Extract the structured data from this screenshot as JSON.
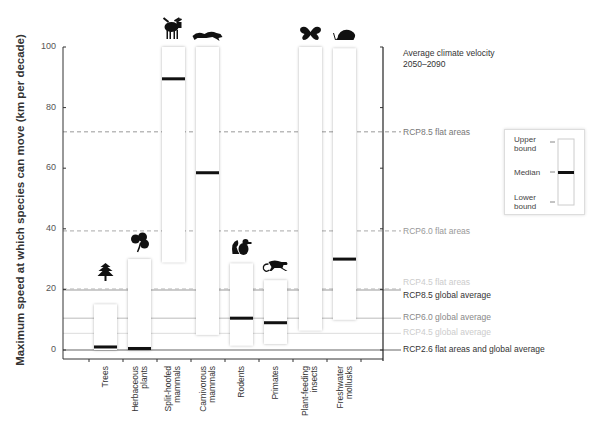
{
  "chart_data": {
    "type": "bar",
    "subtype": "floating-range-with-median",
    "ylabel": "Maximum speed at which species can move (km per decade)",
    "xlabel": "",
    "ylim": [
      0,
      100
    ],
    "yticks": [
      0,
      20,
      40,
      60,
      80,
      100
    ],
    "categories": [
      "Trees",
      "Herbaceous plants",
      "Split-hoofed mammals",
      "Carnivorous mammals",
      "Rodents",
      "Primates",
      "Plant-feeding insects",
      "Freshwater mollusks"
    ],
    "series": [
      {
        "name": "Upper bound",
        "values": [
          15,
          30,
          100,
          100,
          28.5,
          23,
          100,
          99.5
        ]
      },
      {
        "name": "Median",
        "values": [
          1,
          0.5,
          89.5,
          58.5,
          10.5,
          9,
          null,
          30
        ]
      },
      {
        "name": "Lower bound",
        "values": [
          0,
          0,
          29,
          5,
          1.5,
          2,
          6.5,
          10
        ]
      }
    ],
    "reference_lines": [
      {
        "label": "RCP8.5 flat areas",
        "value": 72,
        "style": "dashed",
        "color": "#999999"
      },
      {
        "label": "RCP6.0 flat areas",
        "value": 39.3,
        "style": "dashed",
        "color": "#aaaaaa"
      },
      {
        "label": "RCP4.5 flat areas",
        "value": 20.2,
        "style": "dashed",
        "color": "#cccccc"
      },
      {
        "label": "RCP8.5 global average",
        "value": 19.8,
        "style": "solid",
        "color": "#999999"
      },
      {
        "label": "RCP6.0 global average",
        "value": 10.5,
        "style": "solid",
        "color": "#bbbbbb"
      },
      {
        "label": "RCP4.5 global average",
        "value": 5.5,
        "style": "solid",
        "color": "#dddddd"
      },
      {
        "label": "RCP2.6  flat areas and global average",
        "value": 0,
        "style": "solid",
        "color": "#666666"
      }
    ],
    "right_axis_title": "Average climate velocity 2050–2090",
    "legend": {
      "position": "right",
      "entries": [
        "Upper bound",
        "Median",
        "Lower bound"
      ]
    },
    "grid": false
  },
  "axis": {
    "ylabel": "Maximum speed at which species can move (km per decade)",
    "ticks": [
      "0",
      "20",
      "40",
      "60",
      "80",
      "100"
    ]
  },
  "categories": [
    {
      "label": "Trees",
      "icon": "tree-icon"
    },
    {
      "label": "Herbaceous\nplants",
      "icon": "clover-icon"
    },
    {
      "label": "Split-hoofed\nmammals",
      "icon": "moose-icon"
    },
    {
      "label": "Carnivorous\nmammals",
      "icon": "cougar-icon"
    },
    {
      "label": "Rodents",
      "icon": "squirrel-icon"
    },
    {
      "label": "Primates",
      "icon": "monkey-icon"
    },
    {
      "label": "Plant-feeding\ninsects",
      "icon": "butterfly-icon"
    },
    {
      "label": "Freshwater\nmollusks",
      "icon": "snail-icon"
    }
  ],
  "right_axis": {
    "title_line1": "Average climate velocity",
    "title_line2": "2050–2090",
    "labels": {
      "rcp85_flat": "RCP8.5 flat areas",
      "rcp60_flat": "RCP6.0 flat areas",
      "rcp45_flat": "RCP4.5 flat areas",
      "rcp85_global": "RCP8.5 global average",
      "rcp60_global": "RCP6.0 global average",
      "rcp45_global": "RCP4.5 global average",
      "rcp26": "RCP2.6  flat areas and global average"
    }
  },
  "legend": {
    "upper": "Upper\nbound",
    "median": "Median",
    "lower": "Lower\nbound"
  }
}
